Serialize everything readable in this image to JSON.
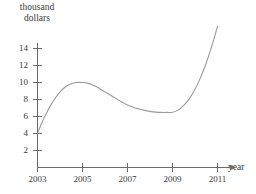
{
  "chart_data": {
    "type": "line",
    "title": "",
    "xlabel": "year",
    "ylabel": "thousand dollars",
    "ylabel_line1": "thousand",
    "ylabel_line2": "dollars",
    "grid": false,
    "legend": false,
    "xlim": [
      2003,
      2011
    ],
    "ylim": [
      0,
      15
    ],
    "x_ticks": [
      2003,
      2005,
      2007,
      2009,
      2011
    ],
    "x_tick_labels": [
      "2003",
      "2005",
      "2007",
      "2009",
      "2011"
    ],
    "y_ticks": [
      2,
      4,
      6,
      8,
      10,
      12,
      14
    ],
    "y_tick_labels": [
      "2",
      "4",
      "6",
      "8",
      "10",
      "12",
      "14"
    ],
    "line_color": "#8a8a8a",
    "axis_color": "#6b6b6b",
    "series": [
      {
        "name": "value",
        "x": [
          2003.0,
          2003.2,
          2003.4,
          2003.6,
          2003.8,
          2004.0,
          2004.25,
          2004.5,
          2004.75,
          2005.0,
          2005.25,
          2005.5,
          2005.75,
          2006.0,
          2006.25,
          2006.5,
          2006.75,
          2007.0,
          2007.25,
          2007.5,
          2007.75,
          2008.0,
          2008.25,
          2008.5,
          2008.75,
          2009.0,
          2009.25,
          2009.5,
          2009.75,
          2010.0,
          2010.25,
          2010.5,
          2010.75,
          2011.0
        ],
        "values": [
          4.0,
          5.3,
          6.4,
          7.4,
          8.2,
          8.9,
          9.5,
          9.85,
          10.0,
          10.0,
          9.9,
          9.65,
          9.3,
          8.9,
          8.5,
          8.1,
          7.7,
          7.35,
          7.1,
          6.9,
          6.72,
          6.6,
          6.52,
          6.48,
          6.48,
          6.5,
          6.75,
          7.3,
          8.1,
          9.2,
          10.6,
          12.3,
          14.3,
          16.6
        ]
      }
    ],
    "annotations": {
      "peak_year": 2005,
      "peak_value": 10,
      "trough_year": 2008.6,
      "trough_value": 6.5,
      "start_value": 4,
      "end_value": 16.6
    }
  }
}
